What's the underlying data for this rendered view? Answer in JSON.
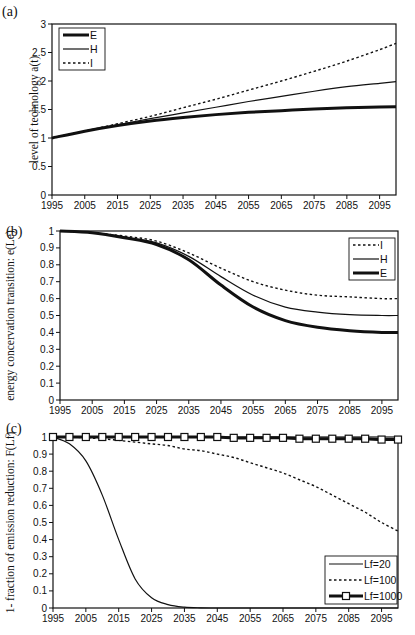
{
  "chart_data": [
    {
      "type": "line",
      "panel_label": "(a)",
      "title": "",
      "xlabel": "",
      "ylabel": "level of technology a(t)",
      "x_ticks": [
        1995,
        2005,
        2015,
        2025,
        2035,
        2045,
        2055,
        2065,
        2075,
        2085,
        2095
      ],
      "xlim": [
        1995,
        2100
      ],
      "y_ticks": [
        0,
        0.5,
        1,
        1.5,
        2,
        2.5,
        3
      ],
      "ylim": [
        0,
        3
      ],
      "grid": false,
      "legend_position": "upper-left",
      "x": [
        1995,
        2005,
        2015,
        2025,
        2035,
        2045,
        2055,
        2065,
        2075,
        2085,
        2095,
        2100
      ],
      "series": [
        {
          "name": "E",
          "style": "thick",
          "values": [
            1.0,
            1.12,
            1.22,
            1.3,
            1.36,
            1.41,
            1.45,
            1.48,
            1.51,
            1.53,
            1.545,
            1.55
          ]
        },
        {
          "name": "H",
          "style": "thin",
          "values": [
            1.0,
            1.12,
            1.23,
            1.34,
            1.44,
            1.54,
            1.64,
            1.73,
            1.82,
            1.9,
            1.96,
            1.99
          ]
        },
        {
          "name": "I",
          "style": "dotted",
          "values": [
            1.0,
            1.12,
            1.25,
            1.38,
            1.53,
            1.68,
            1.84,
            2.0,
            2.17,
            2.35,
            2.55,
            2.66
          ]
        }
      ]
    },
    {
      "type": "line",
      "panel_label": "(b)",
      "title": "",
      "xlabel": "",
      "ylabel": "energy concervation transition: e(Le)",
      "x_ticks": [
        1995,
        2005,
        2015,
        2025,
        2035,
        2045,
        2055,
        2065,
        2075,
        2085,
        2095
      ],
      "xlim": [
        1995,
        2100
      ],
      "y_ticks": [
        0,
        0.1,
        0.2,
        0.3,
        0.4,
        0.5,
        0.6,
        0.7,
        0.8,
        0.9,
        1
      ],
      "ylim": [
        0,
        1
      ],
      "grid": false,
      "legend_position": "upper-right",
      "x": [
        1995,
        2005,
        2015,
        2025,
        2035,
        2045,
        2055,
        2065,
        2075,
        2085,
        2095,
        2100
      ],
      "series": [
        {
          "name": "I",
          "style": "dotted",
          "values": [
            1.0,
            0.99,
            0.97,
            0.94,
            0.87,
            0.78,
            0.7,
            0.65,
            0.62,
            0.61,
            0.6,
            0.6
          ]
        },
        {
          "name": "H",
          "style": "thin",
          "values": [
            1.0,
            0.99,
            0.965,
            0.93,
            0.85,
            0.73,
            0.62,
            0.55,
            0.52,
            0.505,
            0.5,
            0.5
          ]
        },
        {
          "name": "E",
          "style": "thick",
          "values": [
            1.0,
            0.99,
            0.96,
            0.92,
            0.83,
            0.68,
            0.55,
            0.47,
            0.43,
            0.41,
            0.4,
            0.4
          ]
        }
      ]
    },
    {
      "type": "line",
      "panel_label": "(c)",
      "title": "",
      "xlabel": "",
      "ylabel": "1- fraction of emission reduction:  F(Lf)",
      "x_ticks": [
        1995,
        2005,
        2015,
        2025,
        2035,
        2045,
        2055,
        2065,
        2075,
        2085,
        2095
      ],
      "xlim": [
        1995,
        2100
      ],
      "y_ticks": [
        0,
        0.1,
        0.2,
        0.3,
        0.4,
        0.5,
        0.6,
        0.7,
        0.8,
        0.9,
        1
      ],
      "ylim": [
        0,
        1
      ],
      "grid": false,
      "legend_position": "lower-right",
      "x": [
        1995,
        2000,
        2005,
        2010,
        2015,
        2020,
        2025,
        2030,
        2035,
        2040,
        2045,
        2050,
        2055,
        2060,
        2065,
        2070,
        2075,
        2080,
        2085,
        2090,
        2095,
        2100
      ],
      "series": [
        {
          "name": "Lf=20",
          "style": "thin",
          "values": [
            1.0,
            0.96,
            0.86,
            0.66,
            0.4,
            0.17,
            0.06,
            0.02,
            0.005,
            0.001,
            0,
            0,
            0,
            0,
            0,
            0,
            0,
            0,
            0,
            0,
            0,
            0
          ]
        },
        {
          "name": "Lf=100",
          "style": "dotted",
          "values": [
            1.0,
            1.0,
            0.995,
            0.99,
            0.98,
            0.97,
            0.96,
            0.95,
            0.93,
            0.92,
            0.9,
            0.88,
            0.85,
            0.82,
            0.79,
            0.75,
            0.71,
            0.66,
            0.61,
            0.56,
            0.5,
            0.45
          ]
        },
        {
          "name": "Lf=1000",
          "style": "thick-square-markers",
          "values": [
            1.0,
            1.0,
            1.0,
            1.0,
            1.0,
            1.0,
            1.0,
            1.0,
            1.0,
            1.0,
            1.0,
            0.995,
            0.995,
            0.995,
            0.995,
            0.99,
            0.99,
            0.99,
            0.99,
            0.99,
            0.985,
            0.985
          ]
        }
      ]
    }
  ]
}
